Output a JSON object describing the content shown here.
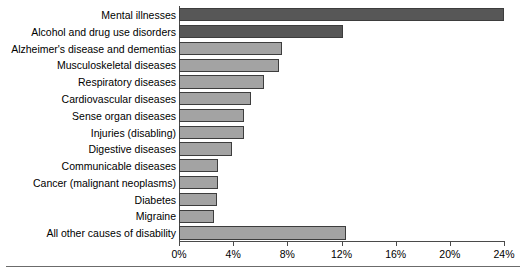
{
  "chart_data": {
    "type": "bar",
    "orientation": "horizontal",
    "title": "",
    "subtitle": "",
    "xlabel": "",
    "ylabel": "",
    "xlim": [
      0,
      24
    ],
    "grid": false,
    "legend": "none",
    "axis_tick_labels": [
      "0%",
      "4%",
      "8%",
      "12%",
      "16%",
      "20%",
      "24%"
    ],
    "axis_tick_values": [
      0,
      4,
      8,
      12,
      16,
      20,
      24
    ],
    "categories": [
      "Mental illnesses",
      "Alcohol and drug use disorders",
      "Alzheimer's disease and dementias",
      "Musculoskeletal diseases",
      "Respiratory diseases",
      "Cardiovascular diseases",
      "Sense organ diseases",
      "Injuries (disabling)",
      "Digestive diseases",
      "Communicable diseases",
      "Cancer (malignant neoplasms)",
      "Diabetes",
      "Migraine",
      "All other causes of disability"
    ],
    "values": [
      24.0,
      12.1,
      7.6,
      7.4,
      6.3,
      5.3,
      4.8,
      4.8,
      3.9,
      2.9,
      2.9,
      2.8,
      2.6,
      12.3
    ],
    "bar_colors": [
      "#575757",
      "#575757",
      "#a3a3a3",
      "#a3a3a3",
      "#a3a3a3",
      "#a3a3a3",
      "#a3a3a3",
      "#a3a3a3",
      "#a3a3a3",
      "#a3a3a3",
      "#a3a3a3",
      "#a3a3a3",
      "#a3a3a3",
      "#a3a3a3"
    ],
    "colors": {
      "bar_dark": "#575757",
      "bar_light": "#a3a3a3",
      "bar_outline": "#3d3d3d",
      "axis": "#4a4a4a",
      "rule": "#6b6b6b",
      "background": "#ffffff",
      "text": "#000000"
    }
  }
}
